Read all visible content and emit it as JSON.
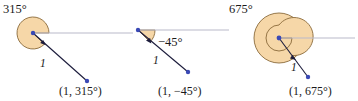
{
  "figure": {
    "width": 358,
    "height": 101,
    "background": "#ffffff",
    "colors": {
      "sector_fill": "#f6d7a8",
      "sector_stroke": "#8a6a3a",
      "terminal_ray": "#1c1c3c",
      "initial_ray": "#b9b9c9",
      "point_dot": "#3a49b5",
      "text": "#1a1a1a"
    }
  },
  "diagrams": [
    {
      "id": "diagram-315",
      "angle_label": "315°",
      "angle_degrees": 315,
      "radius_label": "1",
      "point_label": "(1, 315°)",
      "sweep": "counterclockwise",
      "wraps": 1,
      "vertex": {
        "x": 33,
        "y": 33
      },
      "endpoint": {
        "x": 87,
        "y": 81
      },
      "sector_radius": 16,
      "initial_ray_end_x": 133
    },
    {
      "id": "diagram-neg45",
      "angle_label": "−45°",
      "angle_degrees": -45,
      "radius_label": "1",
      "point_label": "(1, −45°)",
      "sweep": "clockwise",
      "wraps": 1,
      "vertex": {
        "x": 138,
        "y": 30
      },
      "endpoint": {
        "x": 188,
        "y": 72
      },
      "sector_radius": 17,
      "initial_ray_end_x": 229
    },
    {
      "id": "diagram-675",
      "angle_label": "675°",
      "angle_degrees": 675,
      "radius_label": "1",
      "point_label": "(1, 675°)",
      "sweep": "counterclockwise",
      "wraps": 2,
      "vertex": {
        "x": 279,
        "y": 38
      },
      "endpoint": {
        "x": 308,
        "y": 77
      },
      "sector_radius": 25,
      "initial_ray_end_x": 355
    }
  ],
  "labels": {
    "angle_315": "315°",
    "angle_neg45": "−45°",
    "angle_675": "675°",
    "radius_1a": "1",
    "radius_1b": "1",
    "radius_1c": "1",
    "point_315": "(1, 315°)",
    "point_neg45": "(1, −45°)",
    "point_675": "(1, 675°)"
  }
}
